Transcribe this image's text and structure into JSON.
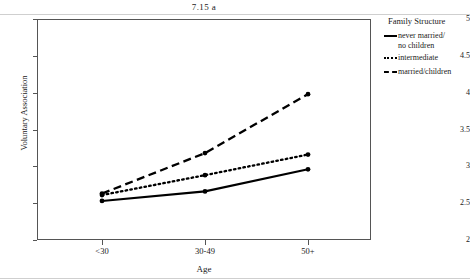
{
  "chart_data": {
    "type": "line",
    "title": "7.15 a",
    "xlabel": "Age",
    "ylabel": "Voluntary Association",
    "categories": [
      "<30",
      "30-49",
      "50+"
    ],
    "ylim": [
      2,
      5
    ],
    "yticks": [
      2,
      2.5,
      3,
      3.5,
      4,
      4.5,
      5
    ],
    "ytick_labels": [
      "2",
      "2.5",
      "3",
      "3.5",
      "4",
      "4.5",
      "5"
    ],
    "grid": false,
    "legend_position": "right",
    "legend_title": "Family Structure",
    "series": [
      {
        "name": "never married/ no children",
        "name_line1": "never married/",
        "name_line2": "no children",
        "style": "solid",
        "color": "#000000",
        "values": [
          2.53,
          2.66,
          2.96
        ]
      },
      {
        "name": "intermediate",
        "name_line1": "intermediate",
        "name_line2": "",
        "style": "dotted",
        "color": "#000000",
        "values": [
          2.61,
          2.88,
          3.16
        ]
      },
      {
        "name": "married/children",
        "name_line1": "married/children",
        "name_line2": "",
        "style": "dashed",
        "color": "#000000",
        "values": [
          2.63,
          3.18,
          3.98
        ]
      }
    ]
  },
  "chart": {
    "title": "7.15 a",
    "axis": {
      "x_label": "Age",
      "y_label": "Voluntary Association",
      "x_ticks": [
        "<30",
        "30-49",
        "50+"
      ],
      "y_ticks": [
        "2",
        "2.5",
        "3",
        "3.5",
        "4",
        "4.5",
        "5"
      ]
    },
    "legend": {
      "title": "Family Structure",
      "entries": [
        {
          "line1": "never married/",
          "line2": "no children",
          "key": "solid-line-key"
        },
        {
          "line1": "intermediate",
          "line2": "",
          "key": "dotted-line-key"
        },
        {
          "line1": "married/children",
          "line2": "",
          "key": "dashed-line-key"
        }
      ]
    }
  }
}
